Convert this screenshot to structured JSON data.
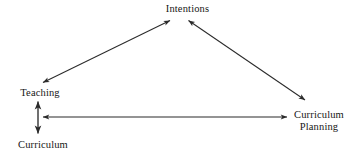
{
  "diagram": {
    "background_color": "#ffffff",
    "line_color": "#2b2b2b",
    "text_color": "#161616",
    "nodes": [
      {
        "id": "intentions",
        "label": "Intentions",
        "position": "top-center"
      },
      {
        "id": "teaching",
        "label": "Teaching",
        "position": "left"
      },
      {
        "id": "curriculum",
        "label": "Curriculum",
        "position": "bottom-left"
      },
      {
        "id": "curriculum-planning",
        "label": "Curriculum\nPlanning",
        "position": "right"
      }
    ],
    "edges": [
      {
        "id": "teaching-intentions",
        "from": "teaching",
        "to": "intentions",
        "style": "double-headed-arrow",
        "orientation": "diagonal-up-right"
      },
      {
        "id": "intentions-curriculum-planning",
        "from": "intentions",
        "to": "curriculum-planning",
        "style": "double-headed-arrow",
        "orientation": "diagonal-down-right"
      },
      {
        "id": "teaching-curriculum",
        "from": "teaching",
        "to": "curriculum",
        "style": "double-headed-arrow",
        "orientation": "vertical"
      },
      {
        "id": "curriculum-curriculum-planning",
        "from": "curriculum",
        "to": "curriculum-planning",
        "style": "double-headed-arrow",
        "orientation": "horizontal"
      }
    ]
  }
}
